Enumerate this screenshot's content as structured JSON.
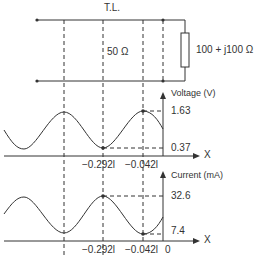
{
  "diagram": {
    "title": "T.L.",
    "line_impedance": "50 Ω",
    "load_impedance": "100 + j100 Ω",
    "colors": {
      "line": "#333333",
      "text": "#333333",
      "background": "#ffffff"
    },
    "voltage_plot": {
      "axis_label": "Voltage (V)",
      "x_label": "X",
      "max_label": "1.63",
      "min_label": "0.37",
      "x_ticks": [
        "−0.292l",
        "−0.042l"
      ]
    },
    "current_plot": {
      "axis_label": "Current (mA)",
      "x_label": "X",
      "max_label": "32.6",
      "min_label": "7.4",
      "x_ticks": [
        "−0.292l",
        "−0.042l",
        "0"
      ]
    }
  }
}
